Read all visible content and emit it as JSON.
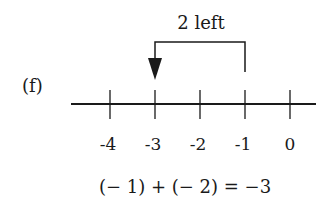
{
  "figure": {
    "part_label": "(f)",
    "jump_label": "2 left",
    "number_line": {
      "ticks": [
        {
          "value": -4,
          "label": "-4"
        },
        {
          "value": -3,
          "label": "-3"
        },
        {
          "value": -2,
          "label": "-2"
        },
        {
          "value": -1,
          "label": "-1"
        },
        {
          "value": 0,
          "label": "0"
        }
      ],
      "start": -1,
      "end": -3,
      "move": -2
    },
    "equation": "(− 1) + (− 2) = −3",
    "colors": {
      "ink": "#1a1a1a",
      "background": "#ffffff"
    }
  }
}
